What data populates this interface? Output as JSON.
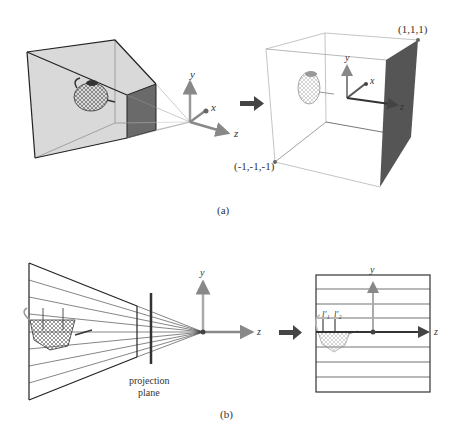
{
  "figure_a": {
    "caption": "(a)",
    "axes": {
      "x": "x",
      "y": "y",
      "z": "z"
    },
    "corner_max_label": "(1,1,1)",
    "corner_min_label": "(-1,-1,-1)"
  },
  "figure_b": {
    "caption": "(b)",
    "axes": {
      "y": "y",
      "z": "z"
    },
    "projection_plane_label_line1": "projection",
    "projection_plane_label_line2": "plane",
    "result_axes": {
      "y": "y",
      "z": "z"
    },
    "line_labels": [
      "l′₁",
      "l′₂"
    ]
  },
  "colors": {
    "frustum_fill": "#d9d9d9",
    "dark_face": "#555555",
    "axis_y": "#9a9a9a",
    "axis_z": "#6e6e6e",
    "arrow": "#444444"
  }
}
